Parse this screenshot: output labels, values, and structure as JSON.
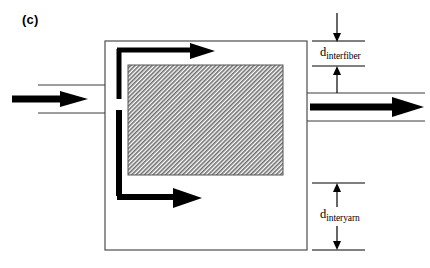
{
  "figure": {
    "panel_label": "(c)",
    "background_color": "#ffffff",
    "line_color": "#000000",
    "thin_line_color": "#3a3a3a",
    "hatch_fill_color": "#9a9a9a"
  },
  "dimensions": [
    {
      "id": "interfiber",
      "symbol": "d",
      "subscript": "interfiber",
      "position": "upper-right",
      "top_tick_y": 41,
      "bottom_tick_y": 66
    },
    {
      "id": "interyarn",
      "symbol": "d",
      "subscript": "interyarn",
      "position": "lower-right",
      "top_tick_y": 183,
      "bottom_tick_y": 250
    }
  ],
  "flow": {
    "inlet_arrow": "bold-right-arrow",
    "outlet_arrow": "bold-right-arrow",
    "upper_bypass_arrow": "bold-right-arrow",
    "lower_bypass_arrow": "bold-right-arrow"
  },
  "geometry": {
    "outer_box": {
      "x": 105,
      "y": 41,
      "width": 202,
      "height": 209
    },
    "hatched_block": {
      "x": 128,
      "y": 65,
      "width": 155,
      "height": 110
    },
    "inlet_channel": {
      "top_y": 85,
      "bottom_y": 113,
      "left_x": 38,
      "right_x": 105
    },
    "outlet_channel": {
      "top_y": 93,
      "bottom_y": 121,
      "left_x": 307,
      "right_x": 425
    }
  }
}
